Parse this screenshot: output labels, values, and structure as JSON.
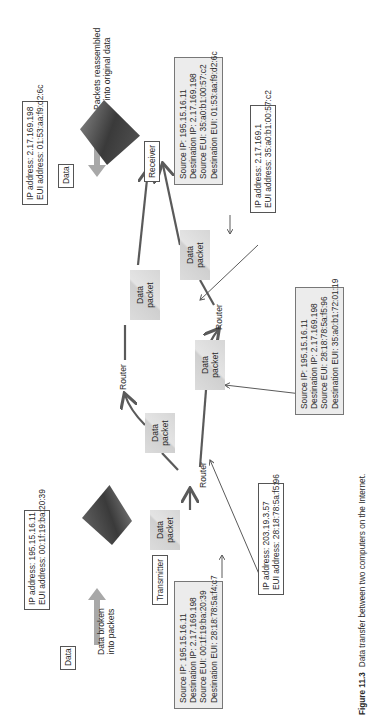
{
  "figure": {
    "caption_number": "Figure 11.3",
    "caption_text": "Data transfer between two computers on the Internet."
  },
  "transmitter": {
    "label": "Transmitter",
    "address_box": [
      "IP address: 195.15.16.11",
      "EUI address: 00:1f:19:ba:20:39"
    ],
    "data_label": "Data",
    "process_label": [
      "Data broken",
      "into packets"
    ],
    "packet_header": [
      "Source IP: 195.15.16.11",
      "Destination IP: 2.17.169.198",
      "Source EUI: 00:1f:19:ba:20:39",
      "Destination EUI: 28:18:78:5a:f4:c7"
    ]
  },
  "receiver": {
    "label": "Receiver",
    "address_box": [
      "IP address: 2.17.169.198",
      "EUI address: 01:53:aa:f9:d2:6c"
    ],
    "data_label": "Data",
    "process_label": [
      "Packets reassembled",
      "into original data"
    ],
    "packet_header": [
      "Source IP: 195.15.16.11",
      "Destination IP: 2.17.169.198",
      "Source EUI: 35:a0:b1:00:57:c2",
      "Destination EUI: 01:53:aa:f9:d2:6c"
    ]
  },
  "routers": [
    {
      "label": "Router",
      "address_box": [
        "IP address: 203.19.3.57",
        "EUI address: 28:18:78:5a:f5:96"
      ]
    },
    {
      "label": "Router"
    },
    {
      "label": "Router",
      "address_box": [
        "IP address: 2.17.169.1",
        "EUI address: 35:a0:b1:00:57:c2"
      ]
    }
  ],
  "middle_packet_header": [
    "Source IP: 195.15.16.11",
    "Destination IP: 2.17.169.198",
    "Source EUI: 28:18:78:5a:f5:96",
    "Destination EUI: 35:a0:b1:72:01:19"
  ],
  "packets": [
    {
      "line1": "Data",
      "line2": "packet"
    },
    {
      "line1": "Data",
      "line2": "packet"
    },
    {
      "line1": "Data",
      "line2": "packet"
    },
    {
      "line1": "Data",
      "line2": "packet"
    },
    {
      "line1": "Data",
      "line2": "packet"
    },
    {
      "line1": "Data",
      "line2": "packet"
    }
  ],
  "colors": {
    "line": "#5a5a5a",
    "packet_fill": "#d6d6d6",
    "header_fill": "#ececec",
    "block_arrow": "#a8a8a8"
  }
}
